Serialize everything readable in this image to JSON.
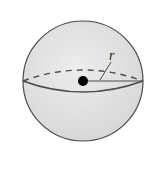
{
  "diagram": {
    "type": "sphere",
    "radius_label": "r",
    "colors": {
      "fill": "#e2e2e2",
      "stroke": "#4a4a4a",
      "center_dot": "#000000"
    },
    "elements": [
      {
        "name": "sphere-outline",
        "shape": "circle"
      },
      {
        "name": "equator-front",
        "style": "solid"
      },
      {
        "name": "equator-back",
        "style": "dashed"
      },
      {
        "name": "center-point",
        "shape": "dot"
      },
      {
        "name": "radius-line",
        "label": "r"
      }
    ]
  }
}
